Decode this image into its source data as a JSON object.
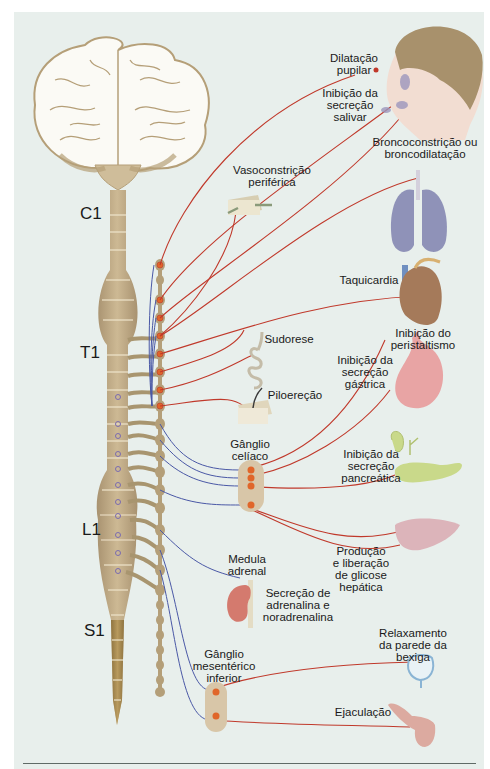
{
  "diagram": {
    "colors": {
      "background": "#e8efec",
      "nerve_tan": "#c2ae8b",
      "preganglionic_blue": "#4a58a6",
      "postganglionic_red": "#c0392b",
      "ganglion_orange": "#e0662a"
    },
    "spinal_levels": [
      {
        "id": "c1",
        "label": "C1"
      },
      {
        "id": "t1",
        "label": "T1"
      },
      {
        "id": "l1",
        "label": "L1"
      },
      {
        "id": "s1",
        "label": "S1"
      }
    ],
    "ganglia": [
      {
        "id": "celiac",
        "label": "Gânglio\ncelíaco"
      },
      {
        "id": "inferior_mesenteric",
        "label": "Gânglio\nmesentérico\ninferior"
      },
      {
        "id": "adrenal_medulla",
        "label": "Medula\nadrenal"
      }
    ],
    "effects": [
      {
        "id": "pupil",
        "organ": "eye",
        "label": "Dilatação\npupilar"
      },
      {
        "id": "salivary",
        "organ": "salivary-glands",
        "label": "Inibição da\nsecreção\nsalivar"
      },
      {
        "id": "lungs",
        "organ": "lungs",
        "label": "Broncoconstrição ou\nbroncodilatação"
      },
      {
        "id": "vessels",
        "organ": "blood-vessel",
        "label": "Vasoconstrição\nperiférica"
      },
      {
        "id": "heart",
        "organ": "heart",
        "label": "Taquicardia"
      },
      {
        "id": "sweat",
        "organ": "sweat-gland",
        "label": "Sudorese"
      },
      {
        "id": "peristalsis",
        "organ": "stomach",
        "label": "Inibição do\nperistaltismo"
      },
      {
        "id": "gastric",
        "organ": "stomach",
        "label": "Inibição da\nsecreção\ngástrica"
      },
      {
        "id": "piloerection",
        "organ": "skin-hair",
        "label": "Piloereção"
      },
      {
        "id": "pancreatic",
        "organ": "pancreas",
        "label": "Inibição da\nsecreção\npancreática"
      },
      {
        "id": "liver",
        "organ": "liver",
        "label": "Produção\ne liberação\nde glicose\nhepática"
      },
      {
        "id": "adrenaline",
        "organ": "adrenal-gland",
        "label": "Secreção de\nadrenalina e\nnoradrenalina"
      },
      {
        "id": "bladder",
        "organ": "bladder",
        "label": "Relaxamento\nda parede da\nbexiga"
      },
      {
        "id": "ejaculation",
        "organ": "genitals",
        "label": "Ejaculação"
      }
    ]
  }
}
